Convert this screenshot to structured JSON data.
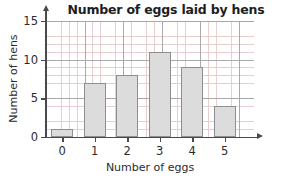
{
  "chart_data": {
    "type": "bar",
    "title": "Number of eggs laid by hens",
    "xlabel": "Number of eggs",
    "ylabel": "Number of hens",
    "categories": [
      "0",
      "1",
      "2",
      "3",
      "4",
      "5"
    ],
    "values": [
      1,
      7,
      8,
      11,
      9,
      4
    ],
    "xlim": [
      -0.5,
      5.9
    ],
    "ylim": [
      0,
      15
    ],
    "x_ticks": [
      "0",
      "1",
      "2",
      "3",
      "4",
      "5"
    ],
    "y_ticks": [
      "0",
      "5",
      "10",
      "15"
    ],
    "grid": true,
    "grid_minor_step": 1,
    "grid_major_step": 5,
    "legend": null,
    "bar_fill_color": "#dcdcdc",
    "bar_edge_color": "#8e8e90",
    "grid_minor_color": "#e7cfd0",
    "grid_major_color": "#a9a9ac",
    "axis_color": "#4a4a4d",
    "background_color": "#ffffff"
  }
}
